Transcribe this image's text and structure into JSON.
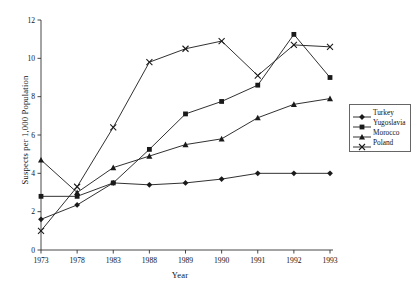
{
  "chart_data": {
    "type": "line",
    "title": "",
    "xlabel": "Year",
    "ylabel": "Suspects per 1,000 Population",
    "categories": [
      "1973",
      "1978",
      "1983",
      "1988",
      "1989",
      "1990",
      "1991",
      "1992",
      "1993"
    ],
    "xlim": [
      0,
      8
    ],
    "ylim": [
      0,
      12
    ],
    "yticks": [
      0,
      2,
      4,
      6,
      8,
      10,
      12
    ],
    "ytick_labels": [
      "0",
      "2",
      "4",
      "6",
      "8",
      "10",
      "12"
    ],
    "grid": false,
    "legend_position": "right",
    "series": [
      {
        "name": "Turkey",
        "marker": "diamond",
        "color": "#1a1a1a",
        "values": [
          1.6,
          2.35,
          3.5,
          3.4,
          3.5,
          3.7,
          4.0,
          4.0,
          4.0
        ]
      },
      {
        "name": "Yugoslavia",
        "marker": "square",
        "color": "#1a1a1a",
        "values": [
          2.8,
          2.8,
          3.5,
          5.25,
          7.1,
          7.75,
          8.6,
          11.25,
          9.0
        ]
      },
      {
        "name": "Morocco",
        "marker": "triangle",
        "color": "#1a1a1a",
        "values": [
          4.7,
          3.0,
          4.3,
          4.9,
          5.5,
          5.8,
          6.9,
          7.6,
          7.9
        ]
      },
      {
        "name": "Poland",
        "marker": "cross",
        "color": "#1a1a1a",
        "values": [
          1.0,
          3.3,
          6.4,
          9.8,
          10.5,
          10.9,
          9.1,
          10.7,
          10.6
        ]
      }
    ]
  },
  "legend": {
    "items": [
      {
        "label": "Turkey"
      },
      {
        "label": "Yugoslavia"
      },
      {
        "label": "Morocco"
      },
      {
        "label": "Poland"
      }
    ]
  }
}
